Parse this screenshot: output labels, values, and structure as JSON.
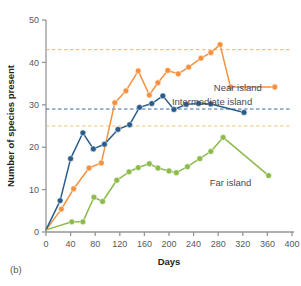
{
  "figure": {
    "panel_label": "(b)",
    "background": "#ffffff"
  },
  "chart_data": {
    "type": "line",
    "title": "",
    "xlabel": "Days",
    "ylabel": "Number of species present",
    "xlim": [
      0,
      400
    ],
    "ylim": [
      0,
      50
    ],
    "xticks": [
      0,
      40,
      80,
      120,
      160,
      200,
      240,
      280,
      320,
      360,
      400
    ],
    "xtick_labels": [
      "0",
      "40",
      "80",
      "120",
      "160",
      "200",
      "240",
      "280",
      "320",
      "360",
      "400"
    ],
    "yticks": [
      0,
      10,
      20,
      30,
      40,
      50
    ],
    "ytick_labels": [
      "0",
      "10",
      "20",
      "30",
      "40",
      "50"
    ],
    "grid": false,
    "legend_position": "inline-annotations",
    "markers": "filled-circle",
    "series": [
      {
        "name": "Near island",
        "color": "#F5913E",
        "label": "Near island",
        "label_x": 312,
        "label_y": 34,
        "points": [
          [
            0,
            0.5
          ],
          [
            25,
            5.4
          ],
          [
            45,
            10.2
          ],
          [
            70,
            15.1
          ],
          [
            90,
            16.3
          ],
          [
            112,
            30.5
          ],
          [
            130,
            33.3
          ],
          [
            150,
            38.0
          ],
          [
            168,
            32.3
          ],
          [
            182,
            35.2
          ],
          [
            198,
            38.1
          ],
          [
            215,
            37.3
          ],
          [
            232,
            38.9
          ],
          [
            252,
            41.0
          ],
          [
            268,
            42.3
          ],
          [
            283,
            44.2
          ],
          [
            300,
            34.2
          ],
          [
            372,
            34.2
          ]
        ]
      },
      {
        "name": "Intermediate island",
        "color": "#2A5C8A",
        "label": "Intermediate island",
        "label_x": 270,
        "label_y": 30.8,
        "points": [
          [
            0,
            0.5
          ],
          [
            23,
            7.4
          ],
          [
            40,
            17.3
          ],
          [
            60,
            23.4
          ],
          [
            77,
            19.6
          ],
          [
            95,
            20.7
          ],
          [
            117,
            24.2
          ],
          [
            136,
            25.3
          ],
          [
            152,
            29.4
          ],
          [
            172,
            30.3
          ],
          [
            190,
            32.1
          ],
          [
            208,
            28.9
          ],
          [
            228,
            30.1
          ],
          [
            248,
            30.3
          ],
          [
            268,
            30.2
          ],
          [
            322,
            28.2
          ]
        ]
      },
      {
        "name": "Far island",
        "color": "#8CBB4B",
        "label": "Far island",
        "label_x": 300,
        "label_y": 11.5,
        "points": [
          [
            0,
            0.5
          ],
          [
            42,
            2.4
          ],
          [
            60,
            2.4
          ],
          [
            78,
            8.2
          ],
          [
            92,
            7.2
          ],
          [
            115,
            12.2
          ],
          [
            135,
            14.2
          ],
          [
            150,
            15.2
          ],
          [
            168,
            16.1
          ],
          [
            182,
            15.1
          ],
          [
            200,
            14.4
          ],
          [
            212,
            14.0
          ],
          [
            230,
            15.4
          ],
          [
            250,
            17.3
          ],
          [
            268,
            19.0
          ],
          [
            288,
            22.3
          ],
          [
            362,
            13.3
          ]
        ]
      }
    ],
    "reference_lines": [
      {
        "name": "near-island-equilibrium",
        "value": 43.0,
        "color": "#F5B173",
        "style": "dashed"
      },
      {
        "name": "intermediate-island-equilibrium",
        "value": 29.0,
        "color": "#3B6E9E",
        "style": "dashed"
      },
      {
        "name": "far-island-equilibrium",
        "value": 25.0,
        "color": "#EFC27E",
        "style": "dashed"
      }
    ]
  }
}
